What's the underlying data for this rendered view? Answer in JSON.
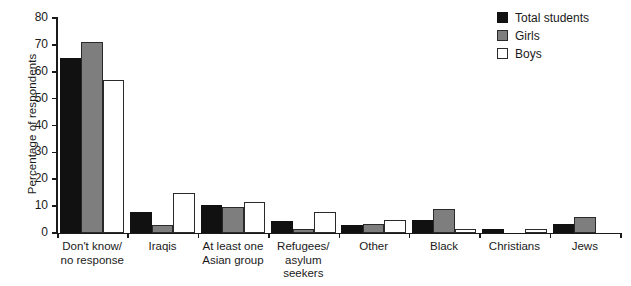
{
  "chart_data": {
    "type": "bar",
    "title": "",
    "xlabel": "",
    "ylabel": "Percentage of respondents",
    "ylim": [
      0,
      80
    ],
    "yticks": [
      0,
      10,
      20,
      30,
      40,
      50,
      60,
      70,
      80
    ],
    "grid": false,
    "legend_position": "top-right",
    "categories": [
      "Don't know/\nno response",
      "Iraqis",
      "At least one\nAsian group",
      "Refugees/\nasylum\nseekers",
      "Other",
      "Black",
      "Christians",
      "Jews"
    ],
    "category_lines": [
      [
        "Don't know/",
        "no response"
      ],
      [
        "Iraqis"
      ],
      [
        "At least one",
        "Asian group"
      ],
      [
        "Refugees/",
        "asylum",
        "seekers"
      ],
      [
        "Other"
      ],
      [
        "Black"
      ],
      [
        "Christians"
      ],
      [
        "Jews"
      ]
    ],
    "series": [
      {
        "name": "Total students",
        "color": "#111111",
        "values": [
          65,
          8,
          10.5,
          4.5,
          3,
          5,
          1.5,
          3.5
        ]
      },
      {
        "name": "Girls",
        "color": "#7e7e7e",
        "values": [
          71,
          3,
          9.5,
          1.5,
          3.5,
          9,
          0,
          6
        ]
      },
      {
        "name": "Boys",
        "color": "#ffffff",
        "values": [
          57,
          15,
          11.5,
          8,
          5,
          1.5,
          1.5,
          0
        ]
      }
    ]
  },
  "legend": {
    "items": [
      {
        "label": "Total students",
        "swatch": "total"
      },
      {
        "label": "Girls",
        "swatch": "girls"
      },
      {
        "label": "Boys",
        "swatch": "boys"
      }
    ]
  }
}
